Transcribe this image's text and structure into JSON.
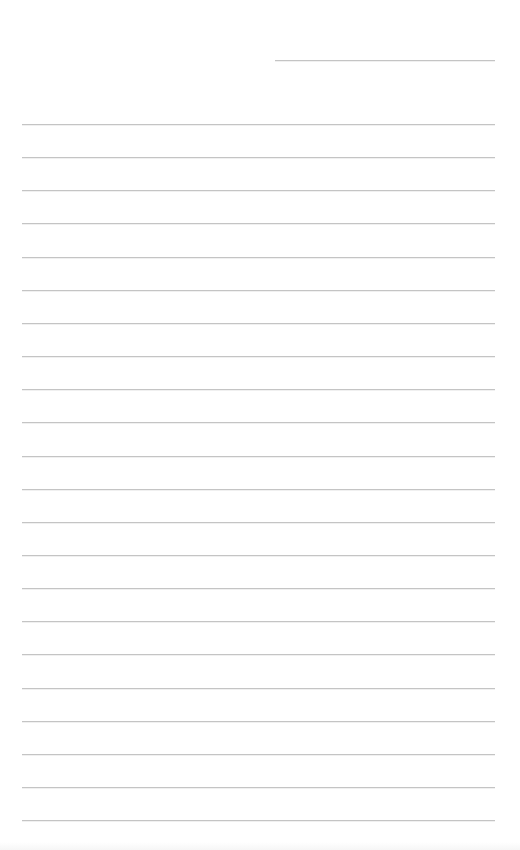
{
  "page": {
    "type": "lined-paper",
    "background_color": "#ffffff",
    "line_color": "#c4c4c4",
    "header_line": {
      "x1": 275,
      "x2": 495,
      "y": 60,
      "text": ""
    },
    "lines": {
      "x1": 22,
      "x2": 495,
      "first_y": 124,
      "spacing": 33.15,
      "count": 22,
      "texts": [
        "",
        "",
        "",
        "",
        "",
        "",
        "",
        "",
        "",
        "",
        "",
        "",
        "",
        "",
        "",
        "",
        "",
        "",
        "",
        "",
        "",
        ""
      ]
    }
  }
}
